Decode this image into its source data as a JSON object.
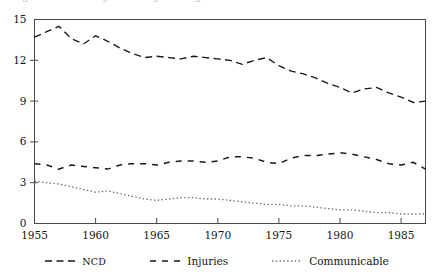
{
  "figure": {
    "title_sliver": "Figure 1. Mortality trends by cause group",
    "background": "#ffffff",
    "ink_color": "#1a1a1a"
  },
  "chart_data": {
    "type": "line",
    "title": "",
    "subtitle": "",
    "xlabel": "",
    "ylabel": "",
    "xlim": [
      1955,
      1987
    ],
    "ylim": [
      0,
      15
    ],
    "grid": false,
    "legend_position": "bottom",
    "xticks": [
      1955,
      1960,
      1965,
      1970,
      1975,
      1980,
      1985
    ],
    "yticks": [
      0,
      3,
      6,
      9,
      12,
      15
    ],
    "x": [
      1955,
      1956,
      1957,
      1958,
      1959,
      1960,
      1961,
      1962,
      1963,
      1964,
      1965,
      1966,
      1967,
      1968,
      1969,
      1970,
      1971,
      1972,
      1973,
      1974,
      1975,
      1976,
      1977,
      1978,
      1979,
      1980,
      1981,
      1982,
      1983,
      1984,
      1985,
      1986,
      1987
    ],
    "series": [
      {
        "name": "NCD",
        "dash": "dashed",
        "color": "#1a1a1a",
        "values": [
          13.7,
          14.1,
          14.5,
          13.6,
          13.2,
          13.8,
          13.4,
          12.9,
          12.5,
          12.2,
          12.3,
          12.2,
          12.1,
          12.3,
          12.2,
          12.1,
          12.0,
          11.7,
          12.0,
          12.2,
          11.6,
          11.2,
          11.0,
          10.7,
          10.3,
          10.0,
          9.6,
          9.9,
          10.0,
          9.6,
          9.3,
          8.9,
          9.0
        ]
      },
      {
        "name": "Injuries",
        "dash": "long-dashed",
        "color": "#1a1a1a",
        "values": [
          4.4,
          4.3,
          4.0,
          4.3,
          4.2,
          4.1,
          4.0,
          4.3,
          4.4,
          4.4,
          4.3,
          4.5,
          4.6,
          4.6,
          4.5,
          4.6,
          4.9,
          4.9,
          4.8,
          4.5,
          4.4,
          4.8,
          5.0,
          5.0,
          5.1,
          5.2,
          5.1,
          4.9,
          4.7,
          4.4,
          4.3,
          4.5,
          4.0
        ]
      },
      {
        "name": "Communicable",
        "dash": "dotted",
        "color": "#6c6c6c",
        "values": [
          3.1,
          3.0,
          2.9,
          2.7,
          2.5,
          2.3,
          2.4,
          2.2,
          2.0,
          1.8,
          1.7,
          1.8,
          1.9,
          1.9,
          1.8,
          1.8,
          1.7,
          1.6,
          1.5,
          1.4,
          1.4,
          1.3,
          1.3,
          1.2,
          1.1,
          1.0,
          1.0,
          0.9,
          0.8,
          0.8,
          0.7,
          0.7,
          0.7
        ]
      }
    ]
  },
  "legend": {
    "entries": [
      {
        "label": "NCD",
        "style": "dashed"
      },
      {
        "label": "Injuries",
        "style": "long-dashed"
      },
      {
        "label": "Communicable",
        "style": "dotted"
      }
    ]
  }
}
